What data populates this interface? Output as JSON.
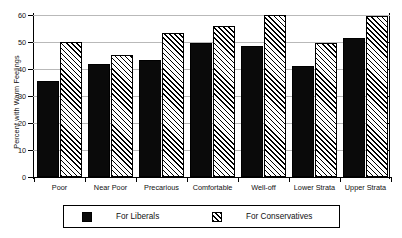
{
  "chart_data": {
    "type": "bar",
    "title": "",
    "xlabel": "",
    "ylabel": "Percent with Warm Feelings",
    "ylim": [
      0,
      60
    ],
    "yticks": [
      0,
      10,
      20,
      30,
      40,
      50,
      60
    ],
    "ytick_labels": [
      "0",
      "10",
      "20",
      "30",
      "40",
      "50",
      "60"
    ],
    "grid": true,
    "legend_position": "bottom",
    "categories": [
      "Poor",
      "Near Poor",
      "Precarious",
      "Comfortable",
      "Well-off",
      "Lower Strata",
      "Upper Strata"
    ],
    "series": [
      {
        "name": "For Liberals",
        "pattern": "solid-black",
        "values": [
          35.6,
          42.0,
          43.2,
          49.5,
          48.6,
          41.0,
          51.5
        ]
      },
      {
        "name": "For Conservatives",
        "pattern": "diagonal-hatch",
        "values": [
          50.0,
          45.3,
          53.5,
          56.0,
          60.0,
          49.5,
          59.5
        ]
      }
    ]
  },
  "legend": {
    "entries": [
      {
        "label": "For Liberals",
        "swatch": "solid-black"
      },
      {
        "label": "For Conservatives",
        "swatch": "diagonal-hatch"
      }
    ]
  }
}
